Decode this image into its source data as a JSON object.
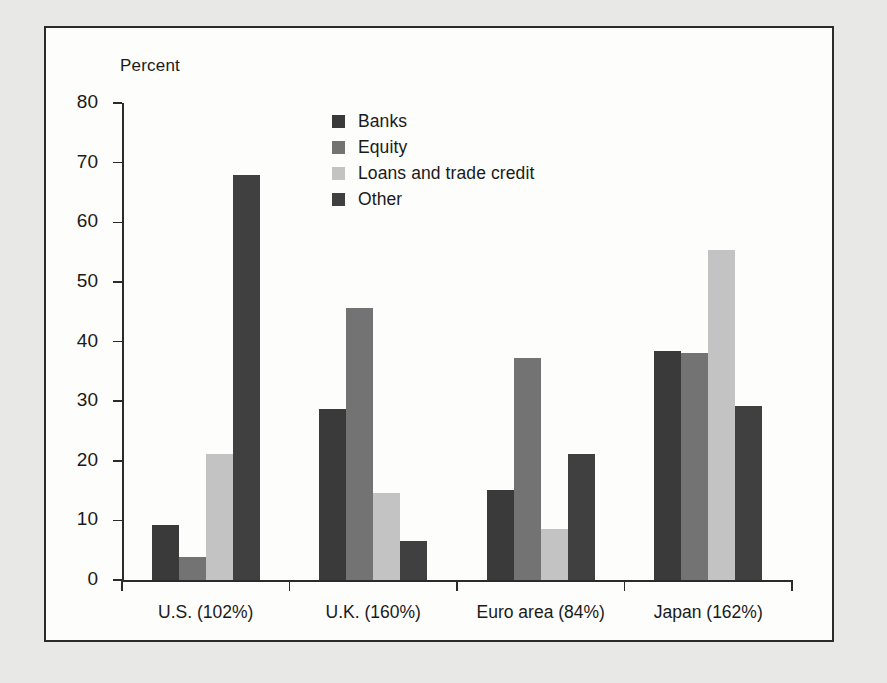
{
  "figure": {
    "background_color": "#e8e8e6",
    "panel_color": "#fdfdfb",
    "border_color": "#2b2b2b"
  },
  "chart_data": {
    "type": "bar",
    "title": "",
    "subtitle": "",
    "xlabel": "",
    "ylabel": "Percent",
    "ylim": [
      0,
      80
    ],
    "ytick_values": [
      0,
      10,
      20,
      30,
      40,
      50,
      60,
      70,
      80
    ],
    "ytick_labels": [
      "0",
      "10",
      "20",
      "30",
      "40",
      "50",
      "60",
      "70",
      "80"
    ],
    "grid": false,
    "legend_position": "upper center",
    "categories": [
      "U.S. (102%)",
      "U.K. (160%)",
      "Euro area (84%)",
      "Japan (162%)"
    ],
    "series": [
      {
        "name": "Banks",
        "color": "#3a3a3a",
        "values": [
          9.2,
          28.6,
          15.1,
          38.4
        ]
      },
      {
        "name": "Equity",
        "color": "#737373",
        "values": [
          3.8,
          45.6,
          37.2,
          38.1
        ]
      },
      {
        "name": "Loans and trade credit",
        "color": "#c3c3c3",
        "values": [
          21.1,
          14.6,
          8.6,
          55.4
        ]
      },
      {
        "name": "Other",
        "color": "#404040",
        "values": [
          68.0,
          6.5,
          21.2,
          29.1
        ]
      }
    ]
  },
  "legend": {
    "items": [
      {
        "label": "Banks",
        "color": "#3a3a3a"
      },
      {
        "label": "Equity",
        "color": "#737373"
      },
      {
        "label": "Loans and trade credit",
        "color": "#c3c3c3"
      },
      {
        "label": "Other",
        "color": "#404040"
      }
    ]
  }
}
